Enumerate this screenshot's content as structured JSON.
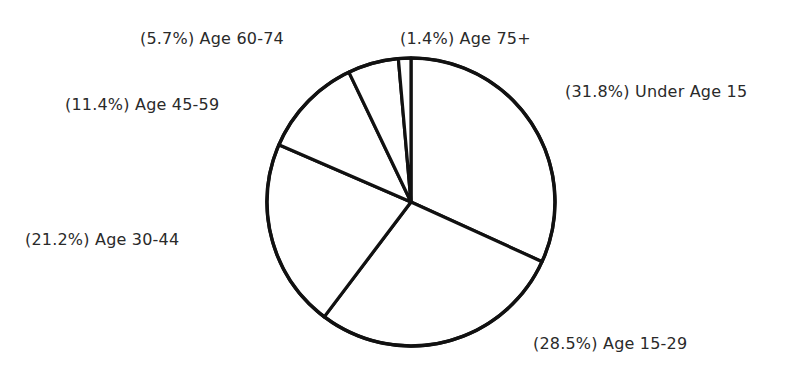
{
  "chart_data": {
    "type": "pie",
    "title": "",
    "start_angle_deg": 0,
    "direction": "clockwise",
    "categories": [
      "Under Age 15",
      "Age 15-29",
      "Age 30-44",
      "Age 45-59",
      "Age 60-74",
      "Age 75+"
    ],
    "values": [
      31.8,
      28.5,
      21.2,
      11.4,
      5.7,
      1.4
    ],
    "unit": "%",
    "labels": [
      "(31.8%) Under Age 15",
      "(28.5%) Age 15-29",
      "(21.2%) Age 30-44",
      "(11.4%) Age 45-59",
      "(5.7%) Age 60-74",
      "(1.4%) Age 75+"
    ],
    "legend": "none (labels placed beside slices)",
    "fill_color": "#ffffff",
    "stroke_color": "#111111"
  },
  "layout": {
    "cx": 411,
    "cy": 202,
    "r": 144,
    "label_positions": [
      {
        "x": 565,
        "y": 97
      },
      {
        "x": 533,
        "y": 349
      },
      {
        "x": 25,
        "y": 245
      },
      {
        "x": 65,
        "y": 110
      },
      {
        "x": 140,
        "y": 44
      },
      {
        "x": 400,
        "y": 44
      }
    ]
  }
}
